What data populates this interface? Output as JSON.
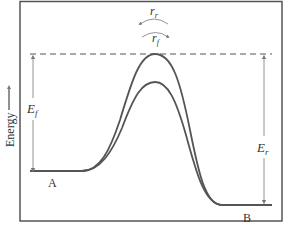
{
  "diagram": {
    "type": "energy-profile",
    "y_axis_label": "Energy",
    "y_axis_arrow": "up-arrow",
    "states": [
      {
        "id": "A",
        "label": "A"
      },
      {
        "id": "B",
        "label": "B"
      }
    ],
    "curves": [
      {
        "id": "outer-curve",
        "description": "higher barrier path"
      },
      {
        "id": "inner-curve",
        "description": "lower barrier path"
      }
    ],
    "annotations": {
      "ef_label": "E",
      "ef_sub": "f",
      "er_label": "E",
      "er_sub": "r",
      "rr_label": "r",
      "rr_sub": "r",
      "rf_label": "r",
      "rf_sub": "f"
    },
    "colors": {
      "frame": "#555555",
      "curve": "#555555",
      "arrow": "#888888",
      "dashed": "#555555",
      "text": "#333333"
    }
  }
}
